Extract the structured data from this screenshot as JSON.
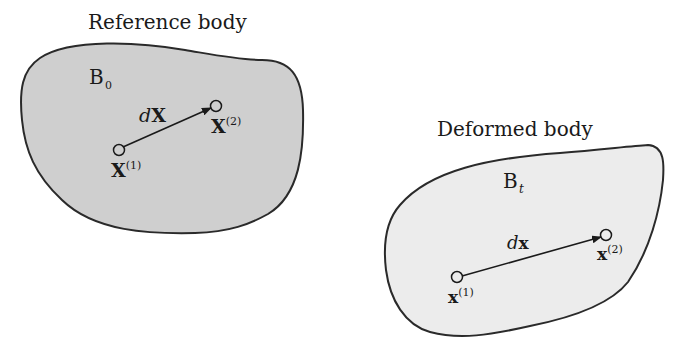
{
  "diagram": {
    "colors": {
      "background": "#ffffff",
      "outline": "#2a2a2a",
      "reference_fill": "#cfcfcf",
      "deformed_fill": "#ececec",
      "text": "#1a1a1a"
    },
    "reference": {
      "title": "Reference body",
      "body_label": "B",
      "body_subscript": "0",
      "vector_d": "d",
      "vector_name": "X",
      "point1": {
        "name": "X",
        "superscript": "(1)"
      },
      "point2": {
        "name": "X",
        "superscript": "(2)"
      }
    },
    "deformed": {
      "title": "Deformed body",
      "body_label": "B",
      "body_subscript": "t",
      "vector_d": "d",
      "vector_name": "x",
      "point1": {
        "name": "x",
        "superscript": "(1)"
      },
      "point2": {
        "name": "x",
        "superscript": "(2)"
      }
    }
  }
}
